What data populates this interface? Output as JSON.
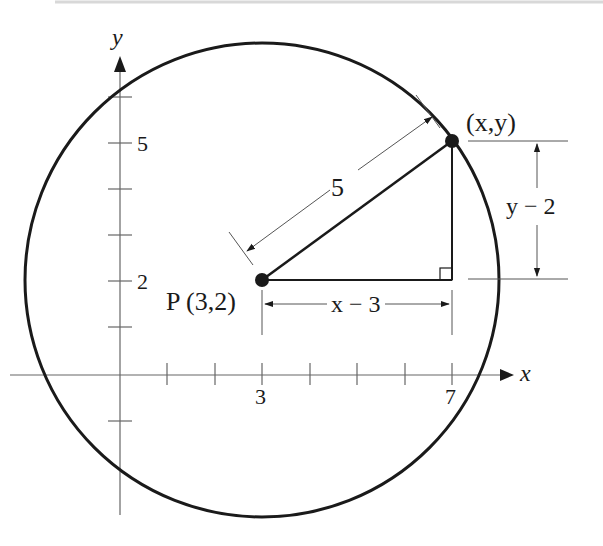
{
  "diagram": {
    "type": "circle-distance-diagram",
    "axes": {
      "x_label": "x",
      "y_label": "y",
      "x_tick_labels": [
        "3",
        "7"
      ],
      "y_tick_labels": [
        "5",
        "2"
      ]
    },
    "center": {
      "name": "P",
      "label": "P (3,2)",
      "x": 3,
      "y": 2
    },
    "point_on_circle": {
      "label": "(x,y)",
      "x": 7,
      "y": 5
    },
    "radius": {
      "label": "5",
      "value": 5
    },
    "horizontal_leg": {
      "label": "x − 3"
    },
    "vertical_leg": {
      "label": "y − 2"
    },
    "colors": {
      "stroke": "#1a1a1a",
      "thin": "#555555",
      "background": "#ffffff"
    }
  }
}
